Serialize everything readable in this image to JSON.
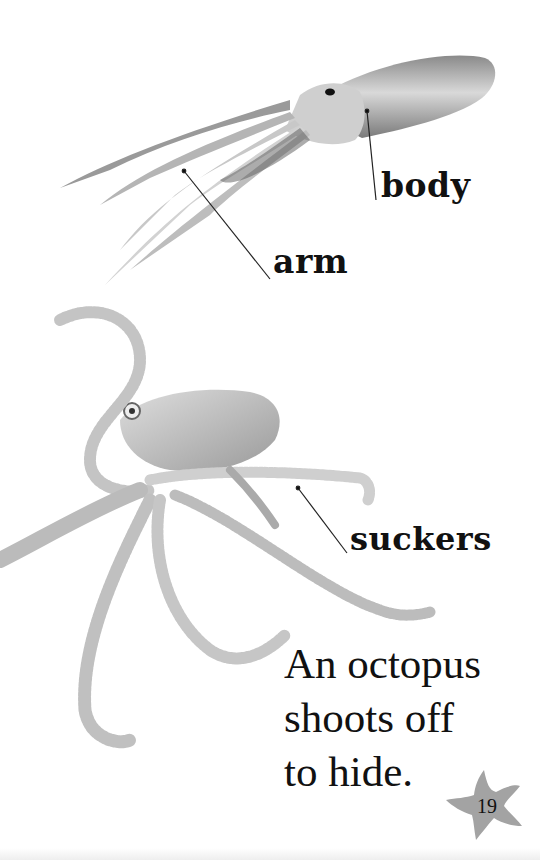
{
  "page": {
    "number": "19",
    "background_color": "#ffffff"
  },
  "labels": {
    "body": "body",
    "arm": "arm",
    "suckers": "suckers"
  },
  "caption": {
    "lines": [
      "An octopus",
      "shoots off",
      "to hide."
    ]
  },
  "illustrations": {
    "top": "squid-photo",
    "bottom": "octopus-photo",
    "page_badge": "starfish-icon"
  },
  "colors": {
    "text": "#111111",
    "creature": "#bdbdbd",
    "creature_dark": "#6e6e6e",
    "starfish": "#a3a3a3",
    "leader_line": "#222222"
  }
}
